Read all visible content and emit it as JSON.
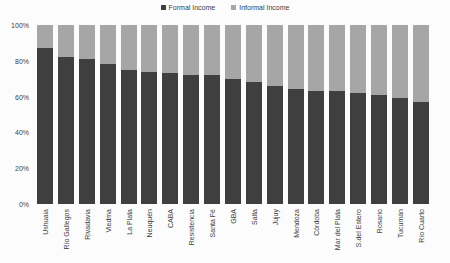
{
  "legend": {
    "formal": "Formal Income",
    "informal": "Informal Income"
  },
  "colors": {
    "formal": "#3f3f3f",
    "informal": "#a6a6a6",
    "background": "#fcfcfc",
    "axis_text": "#404040"
  },
  "chart_data": {
    "type": "bar",
    "stacked": true,
    "stacked_to_100_percent": true,
    "title": "",
    "xlabel": "",
    "ylabel": "",
    "ylim": [
      0,
      100
    ],
    "yticks": [
      "0%",
      "20%",
      "40%",
      "60%",
      "80%",
      "100%"
    ],
    "grid": false,
    "legend_position": "top-center",
    "categories": [
      "Ushuaia",
      "Río Gallegos",
      "Rivadavia",
      "Viedma",
      "La Plata",
      "Neuquén",
      "CABA",
      "Resistencia",
      "Santa Fé",
      "GBA",
      "Salta",
      "Jujuy",
      "Mendoza",
      "Córdoba",
      "Mar del Plata",
      "S.del Estero",
      "Rosario",
      "Tucumán",
      "Río Cuarto"
    ],
    "series": [
      {
        "name": "Formal Income",
        "color": "#3f3f3f",
        "values": [
          87,
          82,
          81,
          78,
          75,
          74,
          73,
          72,
          72,
          70,
          68,
          66,
          64,
          63,
          63,
          62,
          61,
          59,
          57
        ]
      },
      {
        "name": "Informal Income",
        "color": "#a6a6a6",
        "values": [
          13,
          18,
          19,
          22,
          25,
          26,
          27,
          28,
          28,
          30,
          32,
          34,
          36,
          37,
          37,
          38,
          39,
          41,
          43
        ]
      }
    ]
  }
}
